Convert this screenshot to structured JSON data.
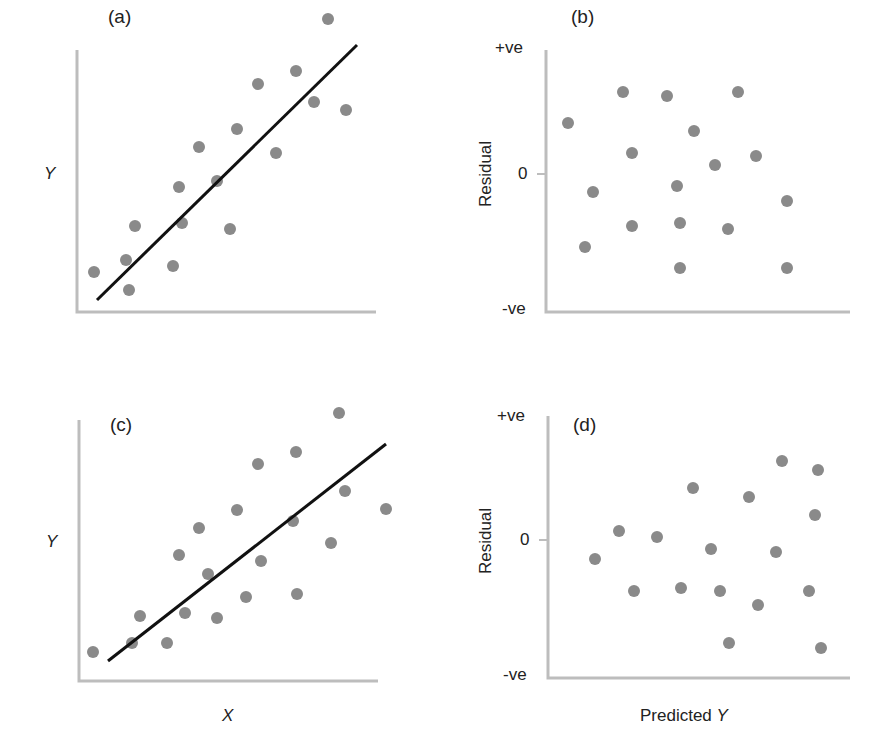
{
  "figure": {
    "panels": [
      {
        "id": "a",
        "label": "(a)",
        "ylabel": "Y",
        "xlabel": ""
      },
      {
        "id": "b",
        "label": "(b)",
        "ylabel": "Residual",
        "ytick_top": "+ve",
        "ytick_zero": "0",
        "ytick_bottom": "-ve",
        "xlabel": ""
      },
      {
        "id": "c",
        "label": "(c)",
        "ylabel": "Y",
        "xlabel": "X"
      },
      {
        "id": "d",
        "label": "(d)",
        "ylabel": "Residual",
        "ytick_top": "+ve",
        "ytick_zero": "0",
        "ytick_bottom": "-ve",
        "xlabel": "Predicted Y"
      }
    ],
    "colors": {
      "point": "#8a8a8a",
      "axis": "#bdbdbd",
      "fit_line": "#111111",
      "text": "#222222"
    }
  },
  "chart_data": [
    {
      "type": "scatter",
      "title": "(a)",
      "xlabel": "",
      "ylabel": "Y",
      "grid": false,
      "note": "Pixel coordinates; data with linear fit line (homoscedastic)",
      "points": [
        [
          94,
          272
        ],
        [
          126,
          260
        ],
        [
          129,
          290
        ],
        [
          135,
          226
        ],
        [
          173,
          266
        ],
        [
          179,
          187
        ],
        [
          182,
          223
        ],
        [
          199,
          147
        ],
        [
          217,
          181
        ],
        [
          230,
          229
        ],
        [
          237,
          129
        ],
        [
          258,
          84
        ],
        [
          276,
          153
        ],
        [
          296,
          71
        ],
        [
          314,
          102
        ],
        [
          328,
          19
        ],
        [
          346,
          110
        ]
      ],
      "fit_line": [
        [
          97,
          300
        ],
        [
          357,
          45
        ]
      ],
      "axes": {
        "origin": [
          77,
          312
        ],
        "y_top": 50,
        "x_right": 376
      }
    },
    {
      "type": "scatter",
      "title": "(b)",
      "xlabel": "",
      "ylabel": "Residual",
      "yticks": [
        "+ve",
        "0",
        "-ve"
      ],
      "grid": false,
      "note": "Residuals evenly scattered about zero",
      "points": [
        [
          568,
          123
        ],
        [
          585,
          247
        ],
        [
          593,
          192
        ],
        [
          623,
          92
        ],
        [
          632,
          153
        ],
        [
          632,
          226
        ],
        [
          667,
          96
        ],
        [
          677,
          186
        ],
        [
          680,
          223
        ],
        [
          680,
          268
        ],
        [
          694,
          131
        ],
        [
          715,
          165
        ],
        [
          728,
          229
        ],
        [
          738,
          92
        ],
        [
          756,
          156
        ],
        [
          787,
          201
        ],
        [
          787,
          268
        ]
      ],
      "axes": {
        "origin": [
          546,
          312
        ],
        "y_top": 50,
        "x_right": 850,
        "zero_y": 174
      }
    },
    {
      "type": "scatter",
      "title": "(c)",
      "xlabel": "X",
      "ylabel": "Y",
      "grid": false,
      "note": "Pixel coordinates; spread increases with X (heteroscedastic)",
      "points": [
        [
          93,
          652
        ],
        [
          132,
          643
        ],
        [
          140,
          616
        ],
        [
          167,
          643
        ],
        [
          179,
          555
        ],
        [
          185,
          613
        ],
        [
          199,
          528
        ],
        [
          208,
          574
        ],
        [
          217,
          618
        ],
        [
          237,
          510
        ],
        [
          246,
          597
        ],
        [
          258,
          464
        ],
        [
          261,
          561
        ],
        [
          293,
          521
        ],
        [
          296,
          452
        ],
        [
          297,
          594
        ],
        [
          331,
          543
        ],
        [
          339,
          413
        ],
        [
          345,
          491
        ],
        [
          386,
          509
        ]
      ],
      "fit_line": [
        [
          108,
          661
        ],
        [
          386,
          444
        ]
      ],
      "axes": {
        "origin": [
          79,
          681
        ],
        "y_top": 420,
        "x_right": 378
      }
    },
    {
      "type": "scatter",
      "title": "(d)",
      "xlabel": "Predicted Y",
      "ylabel": "Residual",
      "yticks": [
        "+ve",
        "0",
        "-ve"
      ],
      "grid": false,
      "note": "Residual spread fans out with predicted Y",
      "points": [
        [
          595,
          559
        ],
        [
          619,
          531
        ],
        [
          634,
          591
        ],
        [
          657,
          537
        ],
        [
          681,
          588
        ],
        [
          693,
          488
        ],
        [
          711,
          549
        ],
        [
          720,
          591
        ],
        [
          729,
          643
        ],
        [
          749,
          497
        ],
        [
          758,
          605
        ],
        [
          776,
          552
        ],
        [
          782,
          461
        ],
        [
          809,
          591
        ],
        [
          815,
          515
        ],
        [
          818,
          470
        ],
        [
          821,
          648
        ]
      ],
      "axes": {
        "origin": [
          548,
          678
        ],
        "y_top": 416,
        "x_right": 850,
        "zero_y": 540
      }
    }
  ]
}
